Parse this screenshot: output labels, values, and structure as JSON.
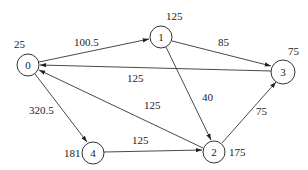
{
  "nodes": [
    {
      "id": "0",
      "label": "0",
      "weight": "25"
    },
    {
      "id": "1",
      "label": "1",
      "weight": "125"
    },
    {
      "id": "2",
      "label": "2",
      "weight": "175"
    },
    {
      "id": "3",
      "label": "3",
      "weight": "75"
    },
    {
      "id": "4",
      "label": "4",
      "weight": "181"
    }
  ],
  "edges": [
    {
      "from": "0",
      "to": "1",
      "label": "100.5"
    },
    {
      "from": "1",
      "to": "3",
      "label": "85"
    },
    {
      "from": "3",
      "to": "0",
      "label": "125"
    },
    {
      "from": "1",
      "to": "2",
      "label": "40"
    },
    {
      "from": "2",
      "to": "0",
      "label": "125"
    },
    {
      "from": "0",
      "to": "4",
      "label": "320.5"
    },
    {
      "from": "4",
      "to": "2",
      "label": "125"
    },
    {
      "from": "2",
      "to": "3",
      "label": "75"
    }
  ]
}
